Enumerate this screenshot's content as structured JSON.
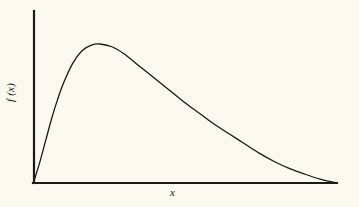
{
  "figure": {
    "background_color": "#faf8ef",
    "ink_color": "#1a1a18",
    "axis_line_width": 2,
    "curve_line_width": 1.3
  },
  "labels": {
    "ylabel": "f (x)",
    "xlabel": "x"
  },
  "chart_data": {
    "type": "line",
    "title": "",
    "subtitle": "",
    "xlabel": "x",
    "ylabel": "f (x)",
    "grid": false,
    "legend": null,
    "tick_labels": {
      "x": [],
      "y": []
    },
    "axis_ranges": {
      "xlim": [
        0,
        1
      ],
      "ylim": [
        0,
        1
      ]
    },
    "series": [
      {
        "name": "density",
        "x": [
          0.0,
          0.02,
          0.04,
          0.06,
          0.08,
          0.1,
          0.13,
          0.16,
          0.19,
          0.22,
          0.26,
          0.3,
          0.34,
          0.38,
          0.42,
          0.46,
          0.5,
          0.55,
          0.6,
          0.65,
          0.7,
          0.75,
          0.8,
          0.85,
          0.9,
          0.95,
          1.0
        ],
        "y": [
          0.0,
          0.14,
          0.3,
          0.46,
          0.6,
          0.72,
          0.86,
          0.95,
          0.99,
          1.0,
          0.98,
          0.93,
          0.86,
          0.79,
          0.72,
          0.65,
          0.58,
          0.5,
          0.42,
          0.35,
          0.28,
          0.21,
          0.15,
          0.1,
          0.06,
          0.025,
          0.0
        ]
      }
    ]
  }
}
